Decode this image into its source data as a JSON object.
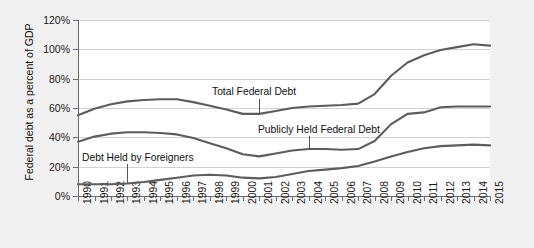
{
  "chart_data": {
    "type": "line",
    "title": "",
    "xlabel": "",
    "ylabel": "Federal debt as a percent of GDP",
    "ylim": [
      0,
      120
    ],
    "ytick_labels": [
      "0%",
      "20%",
      "40%",
      "60%",
      "80%",
      "100%",
      "120%"
    ],
    "ytick_values": [
      0,
      20,
      40,
      60,
      80,
      100,
      120
    ],
    "grid": true,
    "legend_position": "inline-annotations",
    "x": [
      1990,
      1991,
      1992,
      1993,
      1994,
      1995,
      1996,
      1997,
      1998,
      1999,
      2000,
      2001,
      2002,
      2003,
      2004,
      2005,
      2006,
      2007,
      2008,
      2009,
      2010,
      2011,
      2012,
      2013,
      2014,
      2015
    ],
    "categories": [
      "1990",
      "1991",
      "1992",
      "1993",
      "1994",
      "1995",
      "1996",
      "1997",
      "1998",
      "1999",
      "2000",
      "2001",
      "2002",
      "2003",
      "2004",
      "2005",
      "2006",
      "2007",
      "2008",
      "2009",
      "2010",
      "2011",
      "2012",
      "2013",
      "2014",
      "2015"
    ],
    "series": [
      {
        "name": "Total Federal Debt",
        "values": [
          55.0,
          59.5,
          62.5,
          64.5,
          65.5,
          66.0,
          66.0,
          64.0,
          61.5,
          59.0,
          56.0,
          56.0,
          58.0,
          60.0,
          61.0,
          61.5,
          62.0,
          63.0,
          69.5,
          82.0,
          91.0,
          96.0,
          99.5,
          101.5,
          103.5,
          102.5
        ]
      },
      {
        "name": "Publicly Held Federal Debt",
        "values": [
          37.0,
          40.5,
          42.5,
          43.5,
          43.5,
          43.0,
          42.0,
          39.5,
          36.0,
          32.5,
          28.5,
          27.0,
          29.0,
          31.0,
          32.0,
          32.0,
          31.5,
          32.0,
          37.5,
          49.0,
          56.0,
          57.0,
          60.5,
          61.0,
          61.0,
          61.0
        ]
      },
      {
        "name": "Debt Held by Foreigners",
        "values": [
          8.0,
          8.0,
          8.0,
          8.5,
          9.5,
          11.0,
          12.5,
          14.0,
          14.5,
          14.0,
          12.5,
          12.0,
          13.0,
          15.0,
          17.0,
          18.0,
          19.0,
          20.5,
          23.5,
          27.0,
          30.0,
          32.5,
          34.0,
          34.5,
          35.0,
          34.5
        ]
      }
    ],
    "annotations": [
      {
        "id": "total-federal-debt",
        "text": "Total Federal Debt",
        "pointer_year": 2001,
        "pointer_value": 56.0
      },
      {
        "id": "publicly-held-federal-debt",
        "text": "Publicly Held Federal Debt",
        "pointer_year": 2004,
        "pointer_value": 32.0
      },
      {
        "id": "debt-held-by-foreigners",
        "text": "Debt Held by Foreigners",
        "pointer_year": 1993,
        "pointer_value": 8.5
      }
    ],
    "colors": {
      "line": "#5c5c5c",
      "grid": "#d2d2d2",
      "axis": "#6e6e6e",
      "plot_background": "#ffffff",
      "page_background": "#f1f1f1",
      "text": "#111111"
    }
  }
}
